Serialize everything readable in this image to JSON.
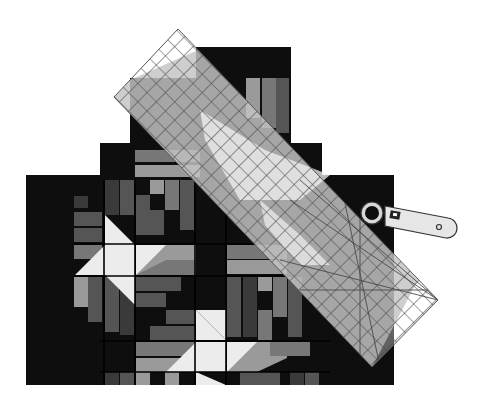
{
  "illustration": {
    "subject": "quilt with ruler and rotary cutter",
    "colors": {
      "background": "#ffffff",
      "quilt_dark": "#0e0e0e",
      "gray_1": "#3a3a3a",
      "gray_2": "#555555",
      "gray_3": "#777777",
      "gray_4": "#9a9a9a",
      "gray_5": "#b8b8b8",
      "light": "#ececec",
      "ruler_tint": "#c8c8c8",
      "ruler_grid": "#4a4a4a"
    },
    "quilt": {
      "name": "quilt",
      "icon": "quilt-icon"
    },
    "ruler": {
      "name": "quilting-ruler",
      "icon": "ruler-icon",
      "corners": [
        [
          178,
          29
        ],
        [
          438,
          300
        ],
        [
          372,
          367
        ],
        [
          114,
          97
        ]
      ]
    },
    "cutter": {
      "name": "rotary-cutter",
      "icon": "rotary-cutter-icon"
    }
  }
}
